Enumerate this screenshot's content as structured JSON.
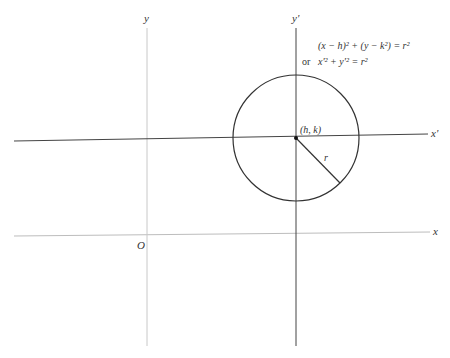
{
  "diagram": {
    "axes": {
      "original": {
        "x_label": "x",
        "y_label": "y",
        "origin_label": "O"
      },
      "translated": {
        "x_label": "x'",
        "y_label": "y'"
      }
    },
    "circle": {
      "center_label": "(h, k)",
      "radius_label": "r"
    },
    "equations": {
      "line1": "(x − h)² + (y − k²) = r²",
      "line2_prefix": "or",
      "line2": "x'² + y'² = r²"
    },
    "colors": {
      "stroke_dark": "#333333",
      "stroke_light": "#bbbbbb",
      "background": "#ffffff"
    }
  }
}
